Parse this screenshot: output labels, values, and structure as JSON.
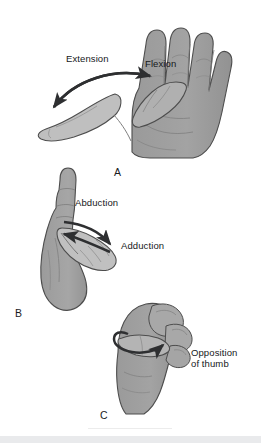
{
  "figure": {
    "background_color": "#ffffff",
    "hand_fill": "#9d9d9d",
    "hand_fill_light": "#bdbdbd",
    "hand_fill_mid": "#adadad",
    "outline_color": "#4a4a4a",
    "arrow_color": "#2e2f31",
    "text_color": "#16181a",
    "footer_band_color": "#e9eaec"
  },
  "panels": [
    {
      "letter": "A",
      "name": "flexion-extension",
      "labels": [
        {
          "text": "Extension",
          "name": "label-extension"
        },
        {
          "text": "Flexion",
          "name": "label-flexion"
        }
      ]
    },
    {
      "letter": "B",
      "name": "abduction-adduction",
      "labels": [
        {
          "text": "Abduction",
          "name": "label-abduction"
        },
        {
          "text": "Adduction",
          "name": "label-adduction"
        }
      ]
    },
    {
      "letter": "C",
      "name": "opposition",
      "labels": [
        {
          "text": "Opposition",
          "name": "label-opposition-line1"
        },
        {
          "text": "of thumb",
          "name": "label-opposition-line2"
        }
      ]
    }
  ]
}
